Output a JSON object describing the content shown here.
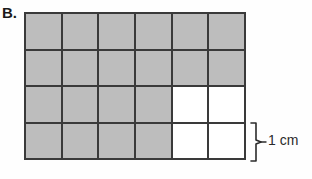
{
  "figure": {
    "part_label": "B.",
    "measure_label": "1 cm"
  },
  "colors": {
    "shaded_cell": "#bdbdbd",
    "empty_cell": "#ffffff",
    "gridline": "#3a3a3a",
    "background": "#fefefe",
    "text": "#1a1a1a"
  },
  "chart_data": {
    "type": "grid",
    "title": "B.",
    "columns": 6,
    "rows": 4,
    "total_cells": 24,
    "shaded_cells": 20,
    "unshaded_cells": 4,
    "cell_size_label": "1 cm",
    "grid": [
      [
        1,
        1,
        1,
        1,
        1,
        1
      ],
      [
        1,
        1,
        1,
        1,
        1,
        1
      ],
      [
        1,
        1,
        1,
        1,
        0,
        0
      ],
      [
        1,
        1,
        1,
        1,
        0,
        0
      ]
    ],
    "annotations": [
      {
        "text": "1 cm",
        "target": "bottom-row-height",
        "position": "right"
      }
    ]
  }
}
